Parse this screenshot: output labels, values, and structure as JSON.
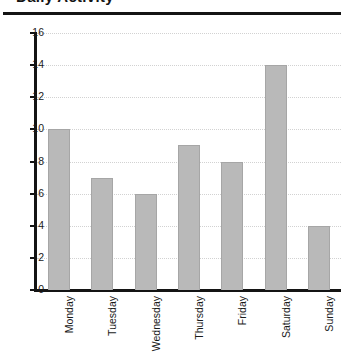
{
  "figure": {
    "clipped_title": "Daily Activity",
    "rule_color": "#141414",
    "bar_color": "#b9b9b9",
    "bar_edge_color": "#a6a6a6",
    "grid_color": "#d2d2d2",
    "axis_color": "#141414"
  },
  "chart_data": {
    "type": "bar",
    "title": "",
    "xlabel": "",
    "ylabel": "",
    "categories": [
      "Monday",
      "Tuesday",
      "Wednesday",
      "Thursday",
      "Friday",
      "Saturday",
      "Sunday"
    ],
    "values": [
      10,
      7,
      6,
      9,
      8,
      14,
      4
    ],
    "ylim": [
      0,
      16
    ],
    "ytick_labels": [
      "0",
      "2",
      "4",
      "6",
      "8",
      "10",
      "12",
      "14",
      "16"
    ],
    "ytick_values": [
      0,
      2,
      4,
      6,
      8,
      10,
      12,
      14,
      16
    ],
    "grid": "horizontal-dotted",
    "legend": "none",
    "xtick_rotation": 90
  }
}
